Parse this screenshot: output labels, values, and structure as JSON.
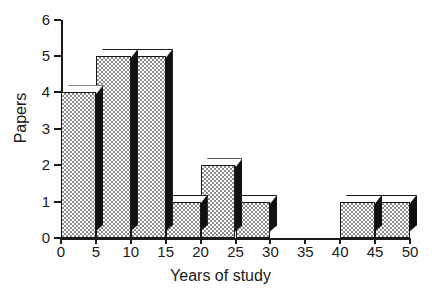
{
  "chart_data": {
    "type": "bar",
    "title": "",
    "subtitle": "",
    "xlabel": "Years of study",
    "ylabel": "Papers",
    "style": "3d-histogram",
    "grid": false,
    "legend": null,
    "bin_width": 5,
    "xlim": [
      0,
      50
    ],
    "ylim": [
      0,
      6
    ],
    "x_ticks": [
      "0",
      "5",
      "10",
      "15",
      "20",
      "25",
      "30",
      "35",
      "40",
      "45",
      "50"
    ],
    "y_ticks": [
      "0",
      "1",
      "2",
      "3",
      "4",
      "5",
      "6"
    ],
    "categories": [
      "0-5",
      "5-10",
      "10-15",
      "15-20",
      "20-25",
      "25-30",
      "30-35",
      "35-40",
      "40-45",
      "45-50"
    ],
    "bin_starts": [
      0,
      5,
      10,
      15,
      20,
      25,
      30,
      35,
      40,
      45
    ],
    "values": [
      4,
      5,
      5,
      1,
      2,
      1,
      0,
      0,
      1,
      1
    ],
    "colors": {
      "front_face": "#b0b0b0",
      "top_face": "#ffffff",
      "side_face": "#111111",
      "outline": "#1a1a1a",
      "axis": "#1a1a1a",
      "background": "#ffffff"
    }
  },
  "axes": {
    "y_title": "Papers",
    "x_title": "Years of study"
  }
}
